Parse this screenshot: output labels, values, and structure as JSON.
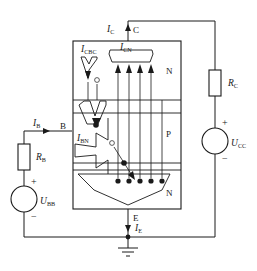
{
  "figure": {
    "type": "bjt-current-flow-diagram"
  },
  "terminals": {
    "collector": "C",
    "base": "B",
    "emitter": "E"
  },
  "regions": [
    {
      "id": "collector-region",
      "label": "N"
    },
    {
      "id": "base-region",
      "label": "P"
    },
    {
      "id": "emitter-region",
      "label": "N"
    }
  ],
  "currents": {
    "ic": {
      "symbol": "I",
      "sub": "C"
    },
    "ib": {
      "symbol": "I",
      "sub": "B"
    },
    "ie": {
      "symbol": "I",
      "sub": "E"
    },
    "icbo": {
      "symbol": "I",
      "sub": "CBC"
    },
    "icn": {
      "symbol": "I",
      "sub": "CN"
    },
    "ibn": {
      "symbol": "I",
      "sub": "BN"
    }
  },
  "components": {
    "rc": {
      "symbol": "R",
      "sub": "C"
    },
    "rb": {
      "symbol": "R",
      "sub": "B"
    },
    "ucc": {
      "symbol": "U",
      "sub": "CC"
    },
    "ubb": {
      "symbol": "U",
      "sub": "BB"
    }
  },
  "polarity": {
    "plus": "+",
    "minus": "−"
  },
  "colors": {
    "ink": "#1a1a1a",
    "background": "#ffffff"
  },
  "counts": {
    "collector_arrows": 4,
    "base_flow_lines": 5,
    "emitter_electron_dots": 5
  }
}
